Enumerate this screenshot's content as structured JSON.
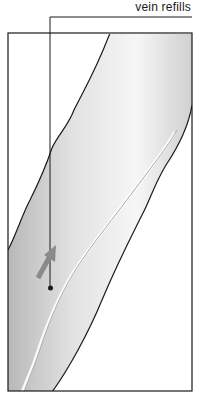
{
  "diagram": {
    "labels": {
      "callout": "vein refills"
    },
    "elements": {
      "frame": "rectangular border",
      "arm": "forearm with superficial vein",
      "arrow": "gray arrow pointing up along vein",
      "marker": "black dot on vein"
    },
    "colors": {
      "outline": "#1a1a1a",
      "skin_light": "#f4f4f4",
      "skin_dark": "#bdbdbd",
      "arrow": "#8a8a8a",
      "background": "#ffffff"
    }
  }
}
